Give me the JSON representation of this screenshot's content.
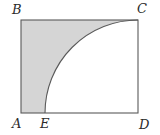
{
  "figure": {
    "kind": "plane-geometry-diagram",
    "labels": {
      "a": "A",
      "b": "B",
      "c": "C",
      "d": "D",
      "e": "E"
    },
    "colors": {
      "shaded_region": "#d5d5d5",
      "stroke": "#5a5a5a",
      "background": "#ffffff",
      "label_text": "#2b2b2b"
    },
    "geometry": {
      "rectangle": {
        "left": 21,
        "top": 20,
        "right": 138,
        "bottom": 113,
        "width": 117,
        "height": 93
      },
      "point_e": {
        "x": 45,
        "y": 113
      },
      "arc": {
        "center": {
          "x": 138,
          "y": 113
        },
        "radius": 93,
        "start": {
          "x": 45,
          "y": 113
        },
        "end": {
          "x": 138,
          "y": 20
        },
        "sweep": "quarter"
      },
      "shaded_path": "M 21 20 L 21 113 L 45 113 A 93 93 0 0 1 138 20 Z"
    }
  }
}
